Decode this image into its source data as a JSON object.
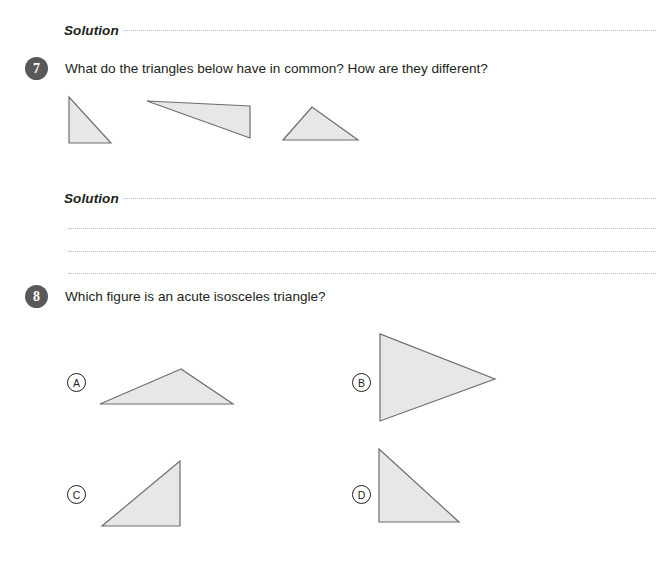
{
  "page": {
    "width": 672,
    "height": 581,
    "background": "#ffffff",
    "ink": "#231f20",
    "dot_color": "#b9bcbe",
    "shape_fill": "#e6e7e8",
    "shape_stroke": "#6d6e71",
    "badge_fill": "#58595b"
  },
  "solutions": [
    {
      "label": "Solution"
    },
    {
      "label": "Solution"
    }
  ],
  "questions": [
    {
      "number": "7",
      "text": "What do the triangles below have in common? How are they different?"
    },
    {
      "number": "8",
      "text": "Which figure is an acute isosceles triangle?"
    }
  ],
  "choices": [
    {
      "letter": "A"
    },
    {
      "letter": "B"
    },
    {
      "letter": "C"
    },
    {
      "letter": "D"
    }
  ],
  "figures": {
    "q7": [
      {
        "name": "right-triangle-small",
        "points": "0,0 0,46 42,46"
      },
      {
        "name": "obtuse-scalene-triangle-wide",
        "points": "0,0 103,37 103,5"
      },
      {
        "name": "acute-triangle-wide",
        "points": "29,0 0,33 75,33"
      }
    ],
    "q8": [
      {
        "name": "choice-a-triangle",
        "points": "81,0 0,35 133,35"
      },
      {
        "name": "choice-b-triangle",
        "points": "0,0 0,87 115,45"
      },
      {
        "name": "choice-c-triangle",
        "points": "78,0 0,65 78,65"
      },
      {
        "name": "choice-d-triangle",
        "points": "0,0 80,73 0,73"
      }
    ]
  }
}
